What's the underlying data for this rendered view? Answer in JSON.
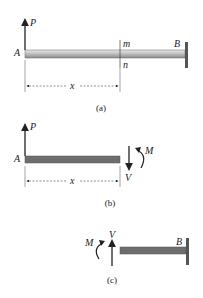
{
  "figure_a": {
    "caption": "(a)",
    "load_label": "P",
    "left_end_label": "A",
    "right_end_label": "B",
    "section_top_label": "m",
    "section_bottom_label": "n",
    "dimension_label": "x"
  },
  "figure_b": {
    "caption": "(b)",
    "load_label": "P",
    "left_end_label": "A",
    "moment_label": "M",
    "shear_label": "V",
    "dimension_label": "x"
  },
  "figure_c": {
    "caption": "(c)",
    "moment_label": "M",
    "shear_label": "V",
    "right_end_label": "B"
  },
  "colors": {
    "beam_light": "#c8c8c8",
    "beam_dark": "#6e6e6e",
    "wall": "#555555",
    "line": "#222222"
  }
}
